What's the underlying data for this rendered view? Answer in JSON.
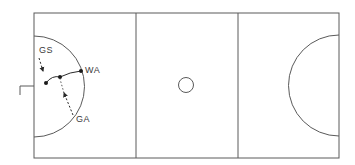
{
  "diagram": {
    "type": "netball-court",
    "line_color": "#4a4a4a",
    "players": [
      {
        "id": "gs",
        "label": "GS"
      },
      {
        "id": "wa",
        "label": "WA"
      },
      {
        "id": "ga",
        "label": "GA"
      }
    ],
    "elements": {
      "court_outline": "court-outline",
      "thirds": [
        "goal-third-left",
        "centre-third",
        "goal-third-right"
      ],
      "centre_circle": "centre-circle",
      "goal_circles": [
        "left-goal-circle",
        "right-goal-circle"
      ],
      "goal_post": "left-goal-post"
    }
  }
}
